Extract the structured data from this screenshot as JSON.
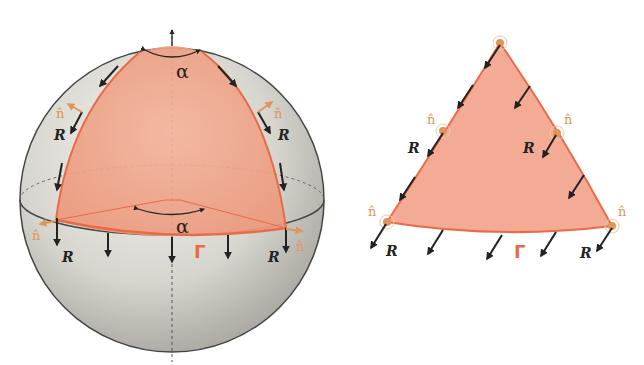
{
  "figure": {
    "left_panel": {
      "description": "Sphere with spherical triangle (lune cap) and parallel transport of vector R",
      "labels": {
        "alpha_top": "α",
        "alpha_bottom": "α",
        "gamma": "Γ",
        "R": "R",
        "n_hat": "n̂"
      }
    },
    "right_panel": {
      "description": "Flattened spherical triangle with transported vector R",
      "labels": {
        "gamma": "Γ",
        "R": "R",
        "n_hat": "n̂"
      }
    },
    "colors": {
      "patch_fill": "#f2a58c",
      "patch_edge": "#ea6a47",
      "n_hat": "#e0955a",
      "arrows": "#222222",
      "sphere_light": "#f0efea",
      "sphere_dark": "#a6a49c"
    }
  }
}
